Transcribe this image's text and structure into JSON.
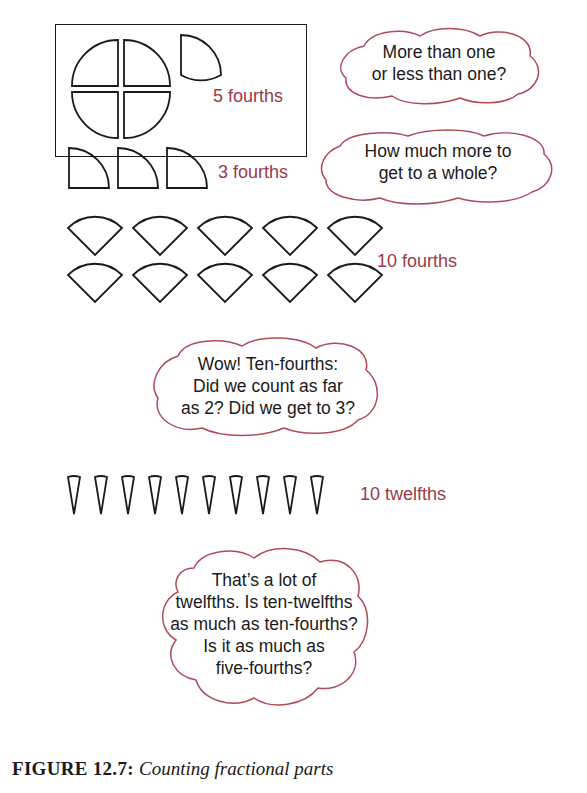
{
  "figure": {
    "caption_label": "FIGURE 12.7:",
    "caption_text": "Counting fractional parts"
  },
  "panels": [
    {
      "id": "five-fourths",
      "label": "5 fourths",
      "shape": "quarter-circle",
      "count": 5,
      "arrangement": "4 pieces forming a whole circle plus 1 separate quarter"
    },
    {
      "id": "three-fourths",
      "label": "3 fourths",
      "shape": "quarter-circle",
      "count": 3
    },
    {
      "id": "ten-fourths",
      "label": "10 fourths",
      "shape": "quarter-circle-wedge",
      "count": 10,
      "rows": 2
    },
    {
      "id": "ten-twelfths",
      "label": "10 twelfths",
      "shape": "twelfth-wedge",
      "count": 10
    }
  ],
  "bubbles": [
    {
      "id": "more-or-less",
      "lines": [
        "More than one",
        "or less than one?"
      ]
    },
    {
      "id": "how-much-more",
      "lines": [
        "How much more to",
        "get to a whole?"
      ]
    },
    {
      "id": "ten-fourths-question",
      "lines": [
        "Wow! Ten-fourths:",
        "Did we count as far",
        "as 2? Did we get to 3?"
      ]
    },
    {
      "id": "twelfths-question",
      "lines": [
        "That’s a lot of",
        "twelfths. Is ten-twelfths",
        "as much as ten-fourths?",
        "Is it as much as",
        "five-fourths?"
      ]
    }
  ],
  "colors": {
    "label": "#9a3a4a",
    "cloud_outline": "#b04a58",
    "stroke": "#1a1a1a"
  }
}
